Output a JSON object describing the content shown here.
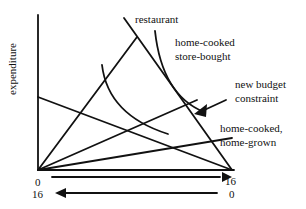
{
  "diagram": {
    "ylabel": "expenditure",
    "labels": {
      "restaurant": "restaurant",
      "home_cooked_store_bought_1": "home-cooked",
      "home_cooked_store_bought_2": "store-bought",
      "new_budget_1": "new budget",
      "new_budget_2": "constraint",
      "home_grown_1": "home-cooked,",
      "home_grown_2": "home-grown"
    },
    "axis": {
      "origin_label": "0",
      "x_max_label": "16",
      "second_left_label": "16",
      "second_right_label": "0"
    }
  }
}
